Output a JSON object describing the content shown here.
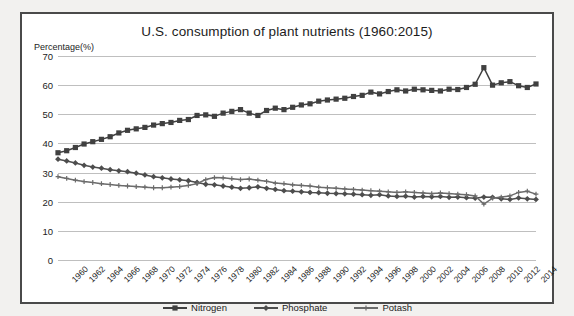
{
  "chart_data": {
    "type": "line",
    "title": "U.S. consumption of plant nutrients (1960:2015)",
    "ylabel": "Percentage(%)",
    "xlabel": "",
    "ylim": [
      0,
      70
    ],
    "ytick_step": 10,
    "yticks": [
      70,
      60,
      50,
      40,
      30,
      20,
      10,
      0
    ],
    "grid": true,
    "legend_position": "bottom",
    "xlim": [
      1960,
      2015
    ],
    "x": [
      1960,
      1961,
      1962,
      1963,
      1964,
      1965,
      1966,
      1967,
      1968,
      1969,
      1970,
      1971,
      1972,
      1973,
      1974,
      1975,
      1976,
      1977,
      1978,
      1979,
      1980,
      1981,
      1982,
      1983,
      1984,
      1985,
      1986,
      1987,
      1988,
      1989,
      1990,
      1991,
      1992,
      1993,
      1994,
      1995,
      1996,
      1997,
      1998,
      1999,
      2000,
      2001,
      2002,
      2003,
      2004,
      2005,
      2006,
      2007,
      2008,
      2009,
      2010,
      2011,
      2012,
      2013,
      2014,
      2015
    ],
    "xtick_labels": [
      "1960",
      "1962",
      "1964",
      "1966",
      "1968",
      "1970",
      "1972",
      "1974",
      "1976",
      "1978",
      "1980",
      "1982",
      "1984",
      "1986",
      "1988",
      "1990",
      "1992",
      "1994",
      "1996",
      "1998",
      "2000",
      "2002",
      "2004",
      "2006",
      "2008",
      "2010",
      "2012",
      "2014"
    ],
    "series": [
      {
        "name": "Nitrogen",
        "color": "#404040",
        "marker": "square",
        "values": [
          36.8,
          37.5,
          38.6,
          39.8,
          40.6,
          41.4,
          42.3,
          43.6,
          44.5,
          45.0,
          45.5,
          46.3,
          46.8,
          47.2,
          47.9,
          48.2,
          49.6,
          49.8,
          49.3,
          50.4,
          51.0,
          51.6,
          50.4,
          49.6,
          51.3,
          52.1,
          51.6,
          52.4,
          53.2,
          53.6,
          54.5,
          54.9,
          55.2,
          55.5,
          56.1,
          56.5,
          57.6,
          57.0,
          57.8,
          58.4,
          58.0,
          58.6,
          58.4,
          58.2,
          58.0,
          58.6,
          58.5,
          59.2,
          60.3,
          66.0,
          60.0,
          60.8,
          61.2,
          59.8,
          59.2,
          60.4
        ]
      },
      {
        "name": "Phosphate",
        "color": "#4d4d4d",
        "marker": "diamond",
        "values": [
          34.6,
          34.0,
          33.3,
          32.5,
          31.9,
          31.5,
          31.0,
          30.6,
          30.3,
          29.8,
          29.2,
          28.6,
          28.2,
          27.8,
          27.5,
          27.2,
          26.6,
          26.0,
          25.8,
          25.4,
          25.0,
          24.6,
          24.8,
          25.1,
          24.6,
          24.2,
          23.8,
          23.6,
          23.4,
          23.2,
          23.1,
          22.9,
          22.8,
          22.7,
          22.6,
          22.4,
          22.2,
          22.4,
          22.0,
          21.8,
          21.9,
          21.6,
          21.8,
          21.7,
          21.8,
          21.5,
          21.6,
          21.4,
          21.2,
          21.6,
          21.5,
          21.0,
          20.8,
          21.3,
          21.0,
          20.8
        ]
      },
      {
        "name": "Potash",
        "color": "#6b6b6b",
        "marker": "plus",
        "values": [
          28.6,
          28.0,
          27.4,
          26.9,
          26.6,
          26.2,
          25.9,
          25.6,
          25.4,
          25.2,
          25.0,
          24.8,
          24.8,
          25.0,
          25.2,
          25.6,
          26.2,
          27.6,
          28.3,
          28.2,
          27.9,
          27.6,
          27.8,
          27.4,
          27.0,
          26.4,
          26.2,
          25.8,
          25.6,
          25.4,
          25.0,
          24.8,
          24.6,
          24.4,
          24.2,
          24.0,
          23.8,
          23.6,
          23.4,
          23.2,
          23.4,
          23.2,
          23.0,
          22.8,
          23.0,
          22.8,
          22.6,
          22.4,
          22.0,
          19.2,
          21.2,
          21.6,
          22.0,
          23.2,
          23.6,
          22.6
        ]
      }
    ]
  },
  "legend": {
    "items": [
      {
        "label": "Nitrogen"
      },
      {
        "label": "Phosphate"
      },
      {
        "label": "Potash"
      }
    ]
  }
}
